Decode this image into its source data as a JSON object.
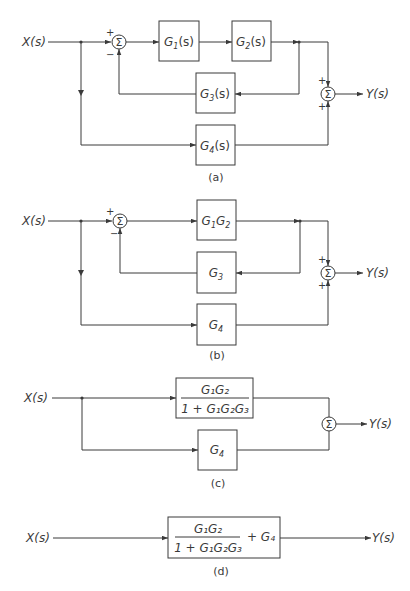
{
  "figure": {
    "diagrams": [
      {
        "id": "a",
        "caption": "(a)",
        "input_label": "X(s)",
        "output_label": "Y(s)",
        "blocks": {
          "g1": {
            "name": "G",
            "sub": "1",
            "suffix": "(s)"
          },
          "g2": {
            "name": "G",
            "sub": "2",
            "suffix": "(s)"
          },
          "g3": {
            "name": "G",
            "sub": "3",
            "suffix": "(s)"
          },
          "g4": {
            "name": "G",
            "sub": "4",
            "suffix": "(s)"
          }
        },
        "sum1": {
          "symbol": "Σ",
          "sign_in": "+",
          "sign_fb": "−"
        },
        "sum2": {
          "symbol": "Σ",
          "sign_top": "+",
          "sign_bottom": "+"
        }
      },
      {
        "id": "b",
        "caption": "(b)",
        "input_label": "X(s)",
        "output_label": "Y(s)",
        "blocks": {
          "g12": {
            "a": "G",
            "a_sub": "1",
            "b": "G",
            "b_sub": "2"
          },
          "g3": {
            "name": "G",
            "sub": "3"
          },
          "g4": {
            "name": "G",
            "sub": "4"
          }
        },
        "sum1": {
          "symbol": "Σ",
          "sign_in": "+",
          "sign_fb": "−"
        },
        "sum2": {
          "symbol": "Σ",
          "sign_top": "+",
          "sign_bottom": "+"
        }
      },
      {
        "id": "c",
        "caption": "(c)",
        "input_label": "X(s)",
        "output_label": "Y(s)",
        "blocks": {
          "closed_loop": {
            "numerator": "G₁G₂",
            "denominator": "1 + G₁G₂G₃"
          },
          "g4": {
            "name": "G",
            "sub": "4"
          }
        },
        "sum": {
          "symbol": "Σ"
        }
      },
      {
        "id": "d",
        "caption": "(d)",
        "input_label": "X(s)",
        "output_label": "Y(s)",
        "blocks": {
          "total": {
            "numerator": "G₁G₂",
            "denominator": "1 + G₁G₂G₃",
            "plus_term": "+ G₄"
          }
        }
      }
    ]
  }
}
